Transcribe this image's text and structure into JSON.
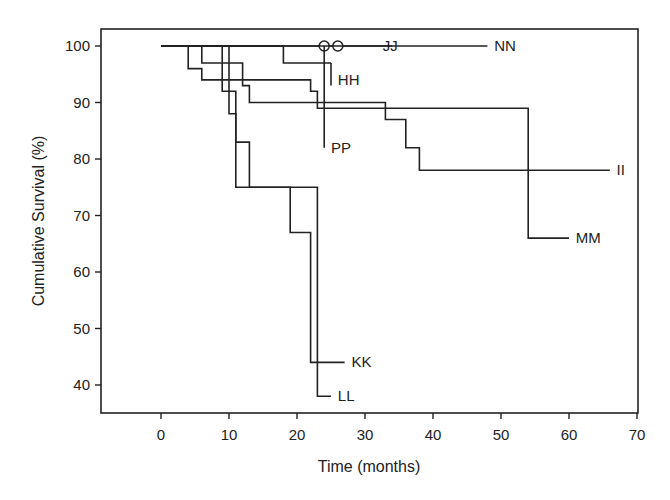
{
  "chart_data": {
    "type": "line",
    "subtype": "kaplan-meier-step",
    "title": "",
    "xlabel": "Time (months)",
    "ylabel": "Cumulative Survival (%)",
    "xlim": [
      -9,
      70
    ],
    "ylim": [
      35,
      103
    ],
    "xticks": [
      0,
      10,
      20,
      30,
      40,
      50,
      60,
      70
    ],
    "yticks": [
      40,
      50,
      60,
      70,
      80,
      90,
      100
    ],
    "grid": false,
    "legend": "inline labels at curve ends",
    "series": [
      {
        "name": "NN",
        "steps": [
          [
            0,
            100
          ],
          [
            48,
            100
          ]
        ],
        "label_at": [
          49,
          100
        ]
      },
      {
        "name": "OO",
        "markers": [
          [
            24,
            100
          ],
          [
            26,
            100
          ]
        ],
        "marker": "circle",
        "label_at": [
          24,
          100
        ]
      },
      {
        "name": "JJ",
        "steps": [
          [
            0,
            100
          ],
          [
            34,
            100
          ]
        ],
        "label_at": [
          34,
          100
        ]
      },
      {
        "name": "HH",
        "steps": [
          [
            0,
            100
          ],
          [
            18,
            100
          ],
          [
            18,
            97
          ],
          [
            25,
            97
          ]
        ],
        "censor_tick": [
          25,
          97,
          93
        ],
        "label_at": [
          26,
          94
        ]
      },
      {
        "name": "PP",
        "steps": [
          [
            24,
            100
          ],
          [
            24,
            82
          ]
        ],
        "label_at": [
          25,
          82
        ]
      },
      {
        "name": "II",
        "steps": [
          [
            0,
            100
          ],
          [
            6,
            100
          ],
          [
            6,
            97
          ],
          [
            12,
            97
          ],
          [
            12,
            93
          ],
          [
            13,
            93
          ],
          [
            13,
            90
          ],
          [
            33,
            90
          ],
          [
            33,
            87
          ],
          [
            36,
            87
          ],
          [
            36,
            82
          ],
          [
            38,
            82
          ],
          [
            38,
            78
          ],
          [
            66,
            78
          ]
        ],
        "label_at": [
          67,
          78
        ]
      },
      {
        "name": "MM",
        "steps": [
          [
            0,
            100
          ],
          [
            4,
            100
          ],
          [
            4,
            96
          ],
          [
            6,
            96
          ],
          [
            6,
            94
          ],
          [
            22,
            94
          ],
          [
            22,
            92
          ],
          [
            23,
            92
          ],
          [
            23,
            89
          ],
          [
            54,
            89
          ],
          [
            54,
            66
          ],
          [
            60,
            66
          ]
        ],
        "label_at": [
          61,
          66
        ]
      },
      {
        "name": "KK",
        "steps": [
          [
            0,
            100
          ],
          [
            9,
            100
          ],
          [
            9,
            92
          ],
          [
            11,
            92
          ],
          [
            11,
            75
          ],
          [
            19,
            75
          ],
          [
            19,
            67
          ],
          [
            22,
            67
          ],
          [
            22,
            44
          ],
          [
            27,
            44
          ]
        ],
        "label_at": [
          28,
          44
        ]
      },
      {
        "name": "LL",
        "steps": [
          [
            0,
            100
          ],
          [
            10,
            100
          ],
          [
            10,
            88
          ],
          [
            11,
            88
          ],
          [
            11,
            83
          ],
          [
            13,
            83
          ],
          [
            13,
            75
          ],
          [
            23,
            75
          ],
          [
            23,
            38
          ],
          [
            25,
            38
          ]
        ],
        "label_at": [
          26,
          38
        ]
      }
    ]
  }
}
